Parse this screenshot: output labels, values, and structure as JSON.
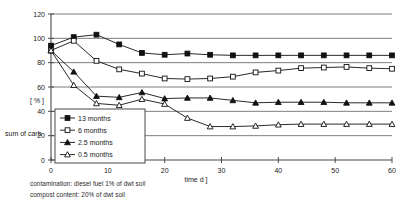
{
  "chart_data": {
    "type": "line",
    "title": "",
    "xlabel": "time  d ]",
    "ylabel": "[ % ]",
    "ylabel_secondary": "sum of carb",
    "xlim": [
      0,
      60
    ],
    "ylim": [
      0,
      120
    ],
    "x_ticks": [
      0,
      10,
      20,
      30,
      40,
      50,
      60
    ],
    "y_ticks": [
      0,
      20,
      40,
      60,
      80,
      100,
      120
    ],
    "x_tick_labels": [
      "0",
      "10",
      "20",
      "30",
      "40",
      "50",
      "60"
    ],
    "y_tick_labels": [
      "0",
      "20",
      "40",
      "60",
      "80",
      "100",
      "120"
    ],
    "grid": true,
    "legend_position": "lower-left-inset",
    "x": [
      0,
      4,
      8,
      12,
      16,
      20,
      24,
      28,
      32,
      36,
      40,
      44,
      48,
      52,
      56,
      60
    ],
    "series": [
      {
        "name": "13  months",
        "marker": "filled-square",
        "values": [
          94,
          101,
          103,
          95,
          88,
          86.5,
          87.5,
          86.5,
          86,
          86,
          86,
          86,
          86,
          86,
          86,
          86
        ]
      },
      {
        "name": "6    months",
        "marker": "open-square",
        "values": [
          90,
          98,
          81.5,
          74.5,
          71,
          67,
          66.5,
          67,
          68.5,
          72,
          73.5,
          75.5,
          76,
          76.5,
          75.5,
          75
        ]
      },
      {
        "name": "2.5 months",
        "marker": "filled-triangle",
        "values": [
          90,
          72.5,
          52.5,
          51.5,
          55.5,
          50.5,
          51,
          51,
          49,
          47,
          47.5,
          47.5,
          47.5,
          47,
          47,
          47
        ]
      },
      {
        "name": "0.5 months",
        "marker": "open-triangle",
        "values": [
          90,
          61.5,
          46.5,
          45,
          50,
          46,
          34.5,
          27.5,
          27.5,
          28,
          29,
          29.5,
          29.5,
          29.5,
          29.5,
          29.5
        ]
      }
    ]
  },
  "legend": {
    "entries": [
      {
        "label": "13  months"
      },
      {
        "label": "6    months"
      },
      {
        "label": "2.5 months"
      },
      {
        "label": "0.5 months"
      }
    ]
  },
  "axis": {
    "y_title": "[ % ]",
    "y_title_secondary": "sum of carb",
    "x_title": "time  d ]"
  },
  "captions": {
    "contamination": "contamination: diesel fuel 1% of dwt soil",
    "compost": "compost content: 20% of dwt soil"
  },
  "colors": {
    "ink": "#111111",
    "grid": "#6f6f6f",
    "background": "#ffffff"
  }
}
